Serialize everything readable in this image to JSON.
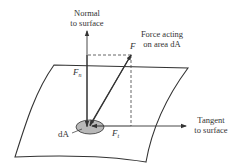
{
  "diagram": {
    "labels": {
      "normal_line1": "Normal",
      "normal_line2": "to surface",
      "force_line1": "Force acting",
      "force_line2": "on area dA",
      "tangent_line1": "Tangent",
      "tangent_line2": "to surface",
      "F": "F",
      "Fn_base": "F",
      "Fn_sub": "n",
      "Ft_base": "F",
      "Ft_sub": "t",
      "dA": "dA"
    },
    "colors": {
      "line": "#333333",
      "dashed": "#555555",
      "area_fill": "#b8b8b8",
      "background": "#ffffff"
    }
  }
}
